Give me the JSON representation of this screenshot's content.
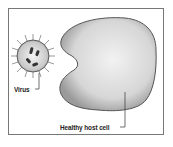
{
  "diagram": {
    "labels": {
      "virus": "Virus",
      "host_cell": "Healthy host cell"
    },
    "colors": {
      "frame": "#777777",
      "cell_fill": "#d8d8d8",
      "cell_stroke": "#444444",
      "virus_fill": "#cfcfcf",
      "line": "#333333"
    }
  }
}
